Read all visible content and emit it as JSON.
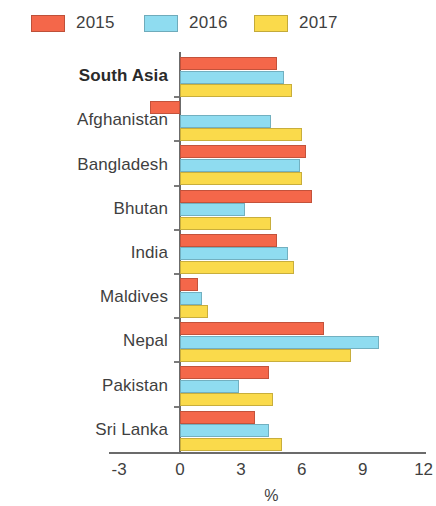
{
  "legend": {
    "items": [
      {
        "label": "2015",
        "color": "#f4674a"
      },
      {
        "label": "2016",
        "color": "#8fdcf0"
      },
      {
        "label": "2017",
        "color": "#fada4b"
      }
    ]
  },
  "axis": {
    "x_title": "%",
    "ticks": [
      "-3",
      "0",
      "3",
      "6",
      "9",
      "12"
    ]
  },
  "chart_data": {
    "type": "bar",
    "orientation": "horizontal",
    "title": "",
    "xlabel": "%",
    "ylabel": "",
    "xlim": [
      -3,
      12
    ],
    "xticks": [
      -3,
      0,
      3,
      6,
      9,
      12
    ],
    "grid": false,
    "legend_position": "top-left",
    "categories": [
      "South Asia",
      "Afghanistan",
      "Bangladesh",
      "Bhutan",
      "India",
      "Maldives",
      "Nepal",
      "Pakistan",
      "Sri Lanka"
    ],
    "highlighted_categories": [
      "South Asia"
    ],
    "series": [
      {
        "name": "2015",
        "color": "#f4674a",
        "values": [
          4.8,
          -1.5,
          6.2,
          6.5,
          4.8,
          0.9,
          7.1,
          4.4,
          3.7
        ]
      },
      {
        "name": "2016",
        "color": "#8fdcf0",
        "values": [
          5.1,
          4.5,
          5.9,
          3.2,
          5.3,
          1.1,
          9.8,
          2.9,
          4.4
        ]
      },
      {
        "name": "2017",
        "color": "#fada4b",
        "values": [
          5.5,
          6.0,
          6.0,
          4.5,
          5.6,
          1.4,
          8.4,
          4.6,
          5.0
        ]
      }
    ]
  }
}
